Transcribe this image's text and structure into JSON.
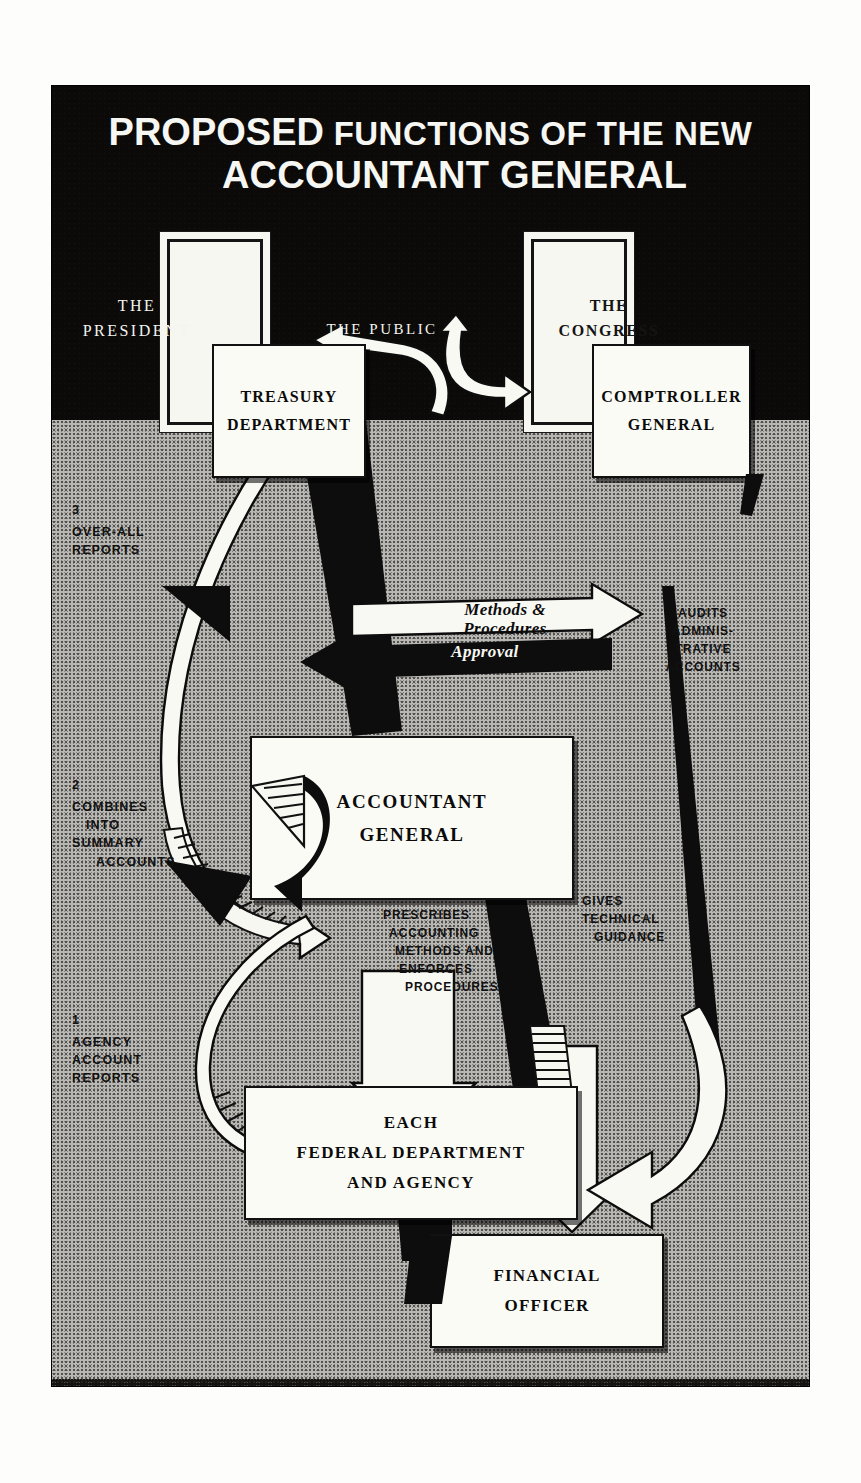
{
  "poster": {
    "title": {
      "line1_emphasis": "PROPOSED",
      "line1_rest": "FUNCTIONS OF THE NEW",
      "line2": "ACCOUNTANT GENERAL"
    },
    "sky_labels": [
      {
        "id": "president",
        "line1": "THE",
        "line2": "PRESIDENT"
      },
      {
        "id": "public",
        "line1": "THE PUBLIC",
        "line2": ""
      },
      {
        "id": "congress",
        "line1": "THE",
        "line2": "CONGRESS"
      }
    ],
    "boxes": [
      {
        "id": "treasury-department",
        "lines": [
          "TREASURY",
          "DEPARTMENT"
        ]
      },
      {
        "id": "comptroller-general",
        "lines": [
          "COMPTROLLER",
          "GENERAL"
        ]
      },
      {
        "id": "accountant-general",
        "lines": [
          "ACCOUNTANT",
          "GENERAL"
        ]
      },
      {
        "id": "federal-department",
        "lines": [
          "EACH",
          "FEDERAL DEPARTMENT",
          "AND AGENCY"
        ]
      },
      {
        "id": "financial-officer",
        "lines": [
          "FINANCIAL",
          "OFFICER"
        ]
      }
    ],
    "flow_labels": [
      {
        "id": "over-all-reports",
        "num": "3",
        "lines": [
          "OVER-ALL",
          "REPORTS"
        ]
      },
      {
        "id": "combines-summary",
        "num": "2",
        "lines": [
          "COMBINES",
          "INTO",
          "SUMMARY",
          "ACCOUNTS"
        ]
      },
      {
        "id": "agency-reports",
        "num": "1",
        "lines": [
          "AGENCY",
          "ACCOUNT",
          "REPORTS"
        ]
      }
    ],
    "arrow_banners": {
      "methods_procedures": {
        "line1": "Methods &",
        "line2": "Procedures"
      },
      "approval": "Approval"
    },
    "arrow_texts": [
      {
        "id": "audits-administrative-accounts",
        "lines": [
          "AUDITS",
          "ADMINIS-",
          "TRATIVE",
          "ACCOUNTS"
        ]
      },
      {
        "id": "prescribes-accounting",
        "lines": [
          "PRESCRIBES",
          "ACCOUNTING",
          "METHODS AND",
          "ENFORCES",
          "PROCEDURES"
        ]
      },
      {
        "id": "gives-technical-guidance",
        "lines": [
          "GIVES",
          "TECHNICAL",
          "GUIDANCE"
        ]
      }
    ],
    "colors": {
      "sky": "#0b0a09",
      "ground": "#b9b7b3",
      "box_fill": "#fbfbf6",
      "ink": "#0d0d0d"
    }
  }
}
